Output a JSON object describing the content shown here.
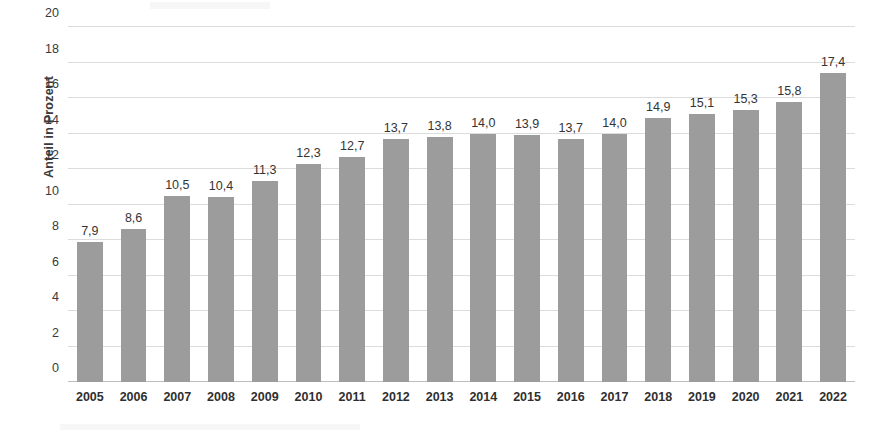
{
  "chart_data": {
    "type": "bar",
    "title": "",
    "xlabel": "",
    "ylabel": "Anteil in Prozent",
    "ylim": [
      0,
      20
    ],
    "yticks": [
      0,
      2,
      4,
      6,
      8,
      10,
      12,
      14,
      16,
      18,
      20
    ],
    "ytick_labels": [
      "0",
      "2",
      "4",
      "6",
      "8",
      "10",
      "12",
      "14",
      "16",
      "18",
      "20"
    ],
    "grid": true,
    "legend": false,
    "bar_color": "#9c9c9c",
    "decimal_separator": ",",
    "categories": [
      "2005",
      "2006",
      "2007",
      "2008",
      "2009",
      "2010",
      "2011",
      "2012",
      "2013",
      "2014",
      "2015",
      "2016",
      "2017",
      "2018",
      "2019",
      "2020",
      "2021",
      "2022"
    ],
    "values": [
      7.9,
      8.6,
      10.5,
      10.4,
      11.3,
      12.3,
      12.7,
      13.7,
      13.8,
      14.0,
      13.9,
      13.7,
      14.0,
      14.9,
      15.1,
      15.3,
      15.8,
      17.4
    ],
    "data_labels": [
      "7,9",
      "8,6",
      "10,5",
      "10,4",
      "11,3",
      "12,3",
      "12,7",
      "13,7",
      "13,8",
      "14,0",
      "13,9",
      "13,7",
      "14,0",
      "14,9",
      "15,1",
      "15,3",
      "15,8",
      "17,4"
    ]
  }
}
